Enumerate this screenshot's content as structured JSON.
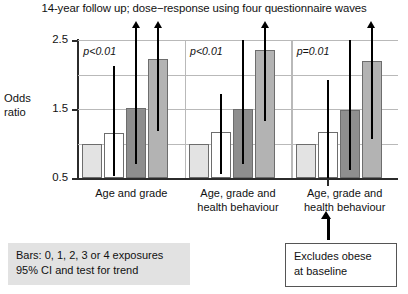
{
  "chart_data": {
    "type": "bar",
    "title": "14-year follow up; dose−response using four questionnaire waves",
    "xlabel": "",
    "ylabel": "Odds ratio",
    "ylim": [
      0.5,
      2.5
    ],
    "yticks": [
      0.5,
      1.5,
      2.5
    ],
    "ytick_labels": [
      "0.5",
      "1.5",
      "2.5"
    ],
    "gridlines": [
      1.0,
      1.5,
      2.0,
      2.5
    ],
    "grid": true,
    "legend_position": "bottom-left",
    "bar_legend": "Bars: 0, 1, 2, 3 or 4 exposures",
    "error_legend": "95% CI and test for trend",
    "series_note": "Each group shows four bars for increasing numbers of exposures; vertical lines are 95% confidence intervals; arrowheads mark intervals extending beyond the top of the axis.",
    "categories": [
      "Age and grade",
      "Age, grade and health behaviour",
      "Age, grade and health behaviour"
    ],
    "groups": [
      {
        "label": "Age and grade",
        "label_lines": [
          "Age and grade"
        ],
        "p_value": "p<0.01",
        "bars": [
          {
            "exposures": 1,
            "odds_ratio": 1.0,
            "fill": "#e3e3e3",
            "ci_low": null,
            "ci_high": null,
            "ci_arrow": false
          },
          {
            "exposures": 2,
            "odds_ratio": 1.15,
            "fill": "#ffffff",
            "ci_low": 0.53,
            "ci_high": 2.12,
            "ci_arrow": false
          },
          {
            "exposures": 3,
            "odds_ratio": 1.52,
            "fill": "#8e8e8e",
            "ci_low": 0.7,
            "ci_high": 2.6,
            "ci_arrow": true
          },
          {
            "exposures": 4,
            "odds_ratio": 2.22,
            "fill": "#b3b3b3",
            "ci_low": 1.18,
            "ci_high": 2.6,
            "ci_arrow": true
          }
        ]
      },
      {
        "label": "Age, grade and health behaviour",
        "label_lines": [
          "Age, grade and",
          "health behaviour"
        ],
        "p_value": "p<0.01",
        "bars": [
          {
            "exposures": 1,
            "odds_ratio": 1.0,
            "fill": "#e3e3e3",
            "ci_low": null,
            "ci_high": null,
            "ci_arrow": false
          },
          {
            "exposures": 2,
            "odds_ratio": 1.16,
            "fill": "#ffffff",
            "ci_low": 0.56,
            "ci_high": 1.72,
            "ci_arrow": false
          },
          {
            "exposures": 3,
            "odds_ratio": 1.5,
            "fill": "#8e8e8e",
            "ci_low": 0.7,
            "ci_high": 2.6,
            "ci_arrow": false
          },
          {
            "exposures": 4,
            "odds_ratio": 2.35,
            "fill": "#b3b3b3",
            "ci_low": 1.32,
            "ci_high": 2.6,
            "ci_arrow": true
          }
        ]
      },
      {
        "label": "Age, grade and health behaviour",
        "label_lines": [
          "Age, grade and",
          "health behaviour"
        ],
        "p_value": "p=0.01",
        "bars": [
          {
            "exposures": 1,
            "odds_ratio": 1.0,
            "fill": "#e3e3e3",
            "ci_low": null,
            "ci_high": null,
            "ci_arrow": false
          },
          {
            "exposures": 2,
            "odds_ratio": 1.16,
            "fill": "#ffffff",
            "ci_low": 0.44,
            "ci_high": 1.92,
            "ci_arrow": false
          },
          {
            "exposures": 3,
            "odds_ratio": 1.48,
            "fill": "#8e8e8e",
            "ci_low": 0.62,
            "ci_high": 2.6,
            "ci_arrow": false
          },
          {
            "exposures": 4,
            "odds_ratio": 2.2,
            "fill": "#b3b3b3",
            "ci_low": 1.07,
            "ci_high": 2.6,
            "ci_arrow": true
          }
        ]
      }
    ],
    "annotation": {
      "text_lines": [
        "Excludes obese",
        "at baseline"
      ],
      "points_to": "Age, grade and health behaviour"
    }
  },
  "legend": {
    "line1": "Bars: 0, 1, 2, 3 or 4 exposures",
    "line2": "95% CI and test for trend"
  },
  "note": {
    "line1": "Excludes obese",
    "line2": "at baseline"
  }
}
